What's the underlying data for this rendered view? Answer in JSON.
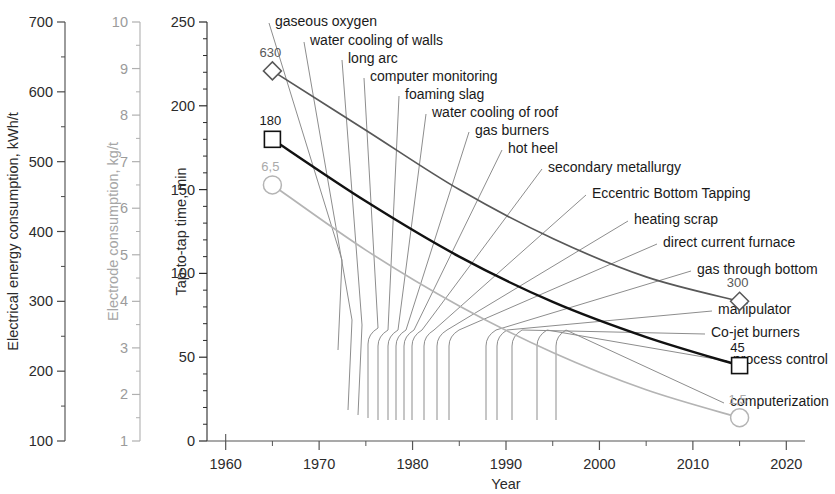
{
  "chart_data": {
    "type": "line",
    "title": "",
    "xlabel": "Year",
    "x_ticks": [
      1960,
      1970,
      1980,
      1990,
      2000,
      2010,
      2020
    ],
    "x_minor_step": 5,
    "xlim": [
      1958,
      2022
    ],
    "grid": false,
    "legend": "none",
    "axes": [
      {
        "id": "energy",
        "label": "Electrical energy consumption, kWh/t",
        "ticks": [
          100,
          200,
          300,
          400,
          500,
          600,
          700
        ],
        "minor_step": 50,
        "lim": [
          100,
          700
        ],
        "color": "#4a4a4a"
      },
      {
        "id": "electrode",
        "label": "Electrode consumption, kg/t",
        "ticks": [
          1,
          2,
          3,
          4,
          5,
          6,
          7,
          8,
          9,
          10
        ],
        "minor_step": 0.5,
        "lim": [
          1,
          10
        ],
        "color": "#b0b0b0"
      },
      {
        "id": "taptotap",
        "label": "Tap-to-tap time, min",
        "ticks": [
          0,
          50,
          100,
          150,
          200,
          250
        ],
        "minor_step": 10,
        "lim": [
          0,
          250
        ],
        "color": "#2b2b2b"
      }
    ],
    "series": [
      {
        "name": "Electrical energy consumption",
        "axis": "energy",
        "marker": "diamond",
        "color": "#585858",
        "start_label": "630",
        "end_label": "300",
        "points": [
          {
            "x": 1965,
            "y": 630
          },
          {
            "x": 1975,
            "y": 545
          },
          {
            "x": 1985,
            "y": 460
          },
          {
            "x": 1995,
            "y": 390
          },
          {
            "x": 2005,
            "y": 335
          },
          {
            "x": 2015,
            "y": 300
          }
        ]
      },
      {
        "name": "Tap-to-tap time",
        "axis": "taptotap",
        "marker": "square",
        "color": "#111111",
        "start_label": "180",
        "end_label": "45",
        "points": [
          {
            "x": 1965,
            "y": 180
          },
          {
            "x": 1975,
            "y": 143
          },
          {
            "x": 1985,
            "y": 110
          },
          {
            "x": 1995,
            "y": 83
          },
          {
            "x": 2005,
            "y": 62
          },
          {
            "x": 2015,
            "y": 45
          }
        ]
      },
      {
        "name": "Electrode consumption",
        "axis": "electrode",
        "marker": "circle",
        "color": "#b4b4b4",
        "start_label": "6,5",
        "end_label": "1,5",
        "points": [
          {
            "x": 1965,
            "y": 6.5
          },
          {
            "x": 1975,
            "y": 5.1
          },
          {
            "x": 1985,
            "y": 3.9
          },
          {
            "x": 1995,
            "y": 2.9
          },
          {
            "x": 2005,
            "y": 2.1
          },
          {
            "x": 2015,
            "y": 1.5
          }
        ]
      }
    ],
    "annotations": [
      {
        "text": "gaseous oxygen",
        "text_x": 275,
        "text_y": 15,
        "anchor_x": 338,
        "anchor_y": 350
      },
      {
        "text": "water cooling of walls",
        "text_x": 310,
        "text_y": 34,
        "anchor_x": 348,
        "anchor_y": 410
      },
      {
        "text": "long arc",
        "text_x": 348,
        "text_y": 52,
        "anchor_x": 358,
        "anchor_y": 415
      },
      {
        "text": "computer monitoring",
        "text_x": 370,
        "text_y": 70,
        "anchor_x": 368,
        "anchor_y": 418
      },
      {
        "text": "foaming slag",
        "text_x": 405,
        "text_y": 88,
        "anchor_x": 378,
        "anchor_y": 420
      },
      {
        "text": "water cooling of roof",
        "text_x": 432,
        "text_y": 106,
        "anchor_x": 388,
        "anchor_y": 420
      },
      {
        "text": "gas burners",
        "text_x": 475,
        "text_y": 124,
        "anchor_x": 396,
        "anchor_y": 420
      },
      {
        "text": "hot heel",
        "text_x": 508,
        "text_y": 142,
        "anchor_x": 404,
        "anchor_y": 420
      },
      {
        "text": "secondary metallurgy",
        "text_x": 548,
        "text_y": 161,
        "anchor_x": 412,
        "anchor_y": 420
      },
      {
        "text": "Eccentric Bottom Tapping",
        "text_x": 592,
        "text_y": 187,
        "anchor_x": 424,
        "anchor_y": 420
      },
      {
        "text": "heating scrap",
        "text_x": 634,
        "text_y": 213,
        "anchor_x": 437,
        "anchor_y": 420
      },
      {
        "text": "direct current furnace",
        "text_x": 663,
        "text_y": 236,
        "anchor_x": 449,
        "anchor_y": 420
      },
      {
        "text": "gas through bottom",
        "text_x": 697,
        "text_y": 263,
        "anchor_x": 486,
        "anchor_y": 420
      },
      {
        "text": "manipulator",
        "text_x": 718,
        "text_y": 303,
        "anchor_x": 497,
        "anchor_y": 420
      },
      {
        "text": "Co-jet burners",
        "text_x": 711,
        "text_y": 326,
        "anchor_x": 512,
        "anchor_y": 420
      },
      {
        "text": "process control",
        "text_x": 733,
        "text_y": 353,
        "anchor_x": 537,
        "anchor_y": 420
      },
      {
        "text": "computerization",
        "text_x": 730,
        "text_y": 395,
        "anchor_x": 556,
        "anchor_y": 420
      }
    ]
  }
}
